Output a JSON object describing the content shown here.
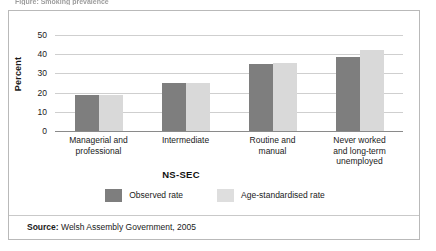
{
  "caption_clip": {
    "text": "Figure: Smoking prevalence"
  },
  "source": {
    "label": "Source:",
    "text": " Welsh Assembly Government, 2005"
  },
  "legend": {
    "items": [
      {
        "label": "Observed rate",
        "color": "#7e7e7e",
        "key": "observed"
      },
      {
        "label": "Age-standardised rate",
        "color": "#dedede",
        "key": "agestd"
      }
    ]
  },
  "chart_data": {
    "type": "bar",
    "title": "",
    "xlabel": "NS-SEC",
    "ylabel": "Percent",
    "ylim": [
      0,
      50
    ],
    "yticks": [
      0,
      10,
      20,
      30,
      40,
      50
    ],
    "ytick_labels": [
      "0",
      "10",
      "20",
      "30",
      "40",
      "50"
    ],
    "grid": true,
    "legend_position": "bottom-center",
    "categories": [
      "Managerial and professional",
      "Intermediate",
      "Routine and manual",
      "Never worked and long-term unemployed"
    ],
    "category_lines": [
      [
        "Managerial and",
        "professional"
      ],
      [
        "Intermediate"
      ],
      [
        "Routine and",
        "manual"
      ],
      [
        "Never worked",
        "and long-term",
        "unemployed"
      ]
    ],
    "series": [
      {
        "name": "Observed rate",
        "color": "#7e7e7e",
        "values": [
          19,
          25,
          35,
          38.5
        ]
      },
      {
        "name": "Age-standardised rate",
        "color": "#d9d9d9",
        "values": [
          19,
          25,
          35.5,
          42
        ]
      }
    ]
  }
}
